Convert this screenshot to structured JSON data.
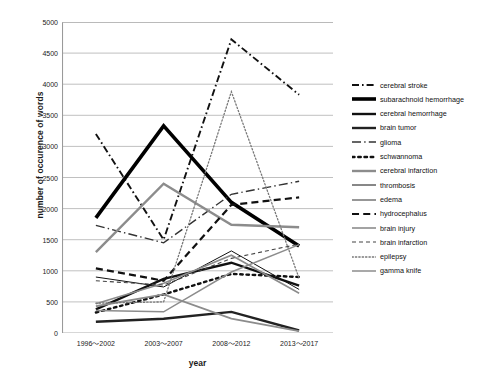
{
  "chart_data": {
    "type": "line",
    "title": "",
    "xlabel": "year",
    "ylabel": "number of occurence of words",
    "categories": [
      "1996〜2002",
      "2003〜2007",
      "2008〜2012",
      "2013〜2017"
    ],
    "ylim": [
      0,
      5000
    ],
    "ytick_step": 500,
    "yticks": [
      "5000",
      "4500",
      "4000",
      "3500",
      "3000",
      "2500",
      "2000",
      "1500",
      "1000",
      "500",
      "0"
    ],
    "grid": true,
    "legend_position": "right",
    "series": [
      {
        "name": "cerebral stroke",
        "values": [
          3200,
          1500,
          4720,
          3830
        ],
        "style": "dashdot",
        "width": 1.9,
        "color": "#111111"
      },
      {
        "name": "subarachnoid hemorrhage",
        "values": [
          1850,
          3330,
          2100,
          1400
        ],
        "style": "solid",
        "width": 3.6,
        "color": "#000000"
      },
      {
        "name": "cerebral hemorrhage",
        "values": [
          380,
          870,
          1130,
          760
        ],
        "style": "solid",
        "width": 2.4,
        "color": "#111111"
      },
      {
        "name": "brain tumor",
        "values": [
          180,
          230,
          340,
          40
        ],
        "style": "solid",
        "width": 2.4,
        "color": "#222222"
      },
      {
        "name": "glioma",
        "values": [
          1730,
          1450,
          2230,
          2440
        ],
        "style": "longdashdot",
        "width": 1.4,
        "color": "#333333"
      },
      {
        "name": "schwannoma",
        "values": [
          330,
          620,
          950,
          900
        ],
        "style": "dotted",
        "width": 2.4,
        "color": "#111111"
      },
      {
        "name": "cerebral infarction",
        "values": [
          1300,
          2400,
          1740,
          1700
        ],
        "style": "solid",
        "width": 2.4,
        "color": "#8c8c8c"
      },
      {
        "name": "thrombosis",
        "values": [
          900,
          740,
          1320,
          700
        ],
        "style": "solid",
        "width": 1.0,
        "color": "#111111"
      },
      {
        "name": "edema",
        "values": [
          430,
          620,
          230,
          30
        ],
        "style": "solid",
        "width": 1.8,
        "color": "#8c8c8c"
      },
      {
        "name": "hydrocephalus",
        "values": [
          1040,
          840,
          2060,
          2180
        ],
        "style": "dashed",
        "width": 2.2,
        "color": "#111111"
      },
      {
        "name": "brain injury",
        "values": [
          470,
          800,
          1250,
          640
        ],
        "style": "solid",
        "width": 1.6,
        "color": "#8c8c8c"
      },
      {
        "name": "brain infarction",
        "values": [
          840,
          770,
          1200,
          1430
        ],
        "style": "shortdash",
        "width": 1.1,
        "color": "#444444"
      },
      {
        "name": "epilepsy",
        "values": [
          480,
          500,
          3880,
          880
        ],
        "style": "dotted",
        "width": 1.3,
        "color": "#777777"
      },
      {
        "name": "gamma knife",
        "values": [
          360,
          340,
          980,
          1420
        ],
        "style": "solid",
        "width": 1.5,
        "color": "#8c8c8c"
      }
    ]
  },
  "legend": {
    "items": [
      {
        "label": "cerebral stroke"
      },
      {
        "label": "subarachnoid hemorrhage"
      },
      {
        "label": "cerebral hemorrhage"
      },
      {
        "label": "brain tumor"
      },
      {
        "label": "glioma"
      },
      {
        "label": "schwannoma"
      },
      {
        "label": "cerebral infarction"
      },
      {
        "label": "thrombosis"
      },
      {
        "label": "edema"
      },
      {
        "label": "hydrocephalus"
      },
      {
        "label": "brain injury"
      },
      {
        "label": "brain infarction"
      },
      {
        "label": "epilepsy"
      },
      {
        "label": "gamma knife"
      }
    ]
  }
}
